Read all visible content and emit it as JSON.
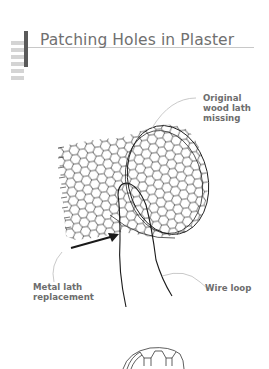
{
  "header": {
    "title": "Patching Holes in Plaster",
    "stripe_count": 6
  },
  "illustration": {
    "callouts": {
      "original_wood_lath": [
        "Original",
        "wood lath",
        "missing"
      ],
      "metal_lath": [
        "Metal lath",
        "replacement"
      ],
      "wire_loop": [
        "Wire loop"
      ]
    }
  },
  "colors": {
    "title": "#707070",
    "accent_bar": "#5a5a5a",
    "stripes": "#d4d4d4",
    "line_art": "#1a1a1a",
    "leader": "#bbbbbb"
  }
}
